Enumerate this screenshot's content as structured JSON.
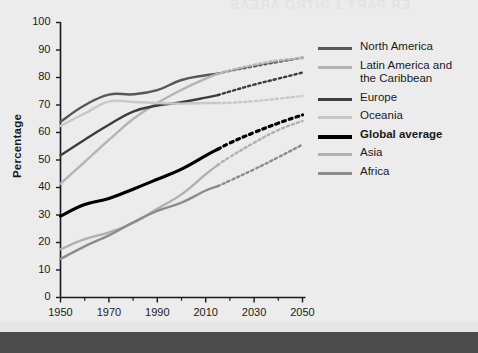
{
  "page": {
    "background_color": "#ececec",
    "footer_bar_color": "#4b4b4b",
    "bleed_text": "ER PART 1 INTRO AREAS",
    "bleed_text_small": "world population, 1950-2050"
  },
  "chart_data": {
    "type": "line",
    "title": "",
    "subtitle": "",
    "xlabel": "",
    "ylabel": "Percentage",
    "xlim": [
      1950,
      2050
    ],
    "ylim": [
      0,
      100
    ],
    "grid": false,
    "legend_position": "right",
    "x_ticks": [
      "1950",
      "1970",
      "1990",
      "2010",
      "2030",
      "2050"
    ],
    "x_tick_values": [
      1950,
      1970,
      1990,
      2010,
      2030,
      2050
    ],
    "x_minor_ticks": [
      1960,
      1980,
      2000,
      2020,
      2040
    ],
    "y_ticks": [
      "0",
      "10",
      "20",
      "30",
      "40",
      "50",
      "60",
      "70",
      "80",
      "90",
      "100"
    ],
    "y_tick_values": [
      0,
      10,
      20,
      30,
      40,
      50,
      60,
      70,
      80,
      90,
      100
    ],
    "projection_start_year": 2015,
    "x": [
      1950,
      1960,
      1970,
      1980,
      1990,
      2000,
      2010,
      2015,
      2020,
      2030,
      2040,
      2050
    ],
    "series": [
      {
        "name": "North America",
        "color": "#575757",
        "width": 2.4,
        "values": [
          63.9,
          69.9,
          73.8,
          73.9,
          75.4,
          79.1,
          80.8,
          81.4,
          82.4,
          84.1,
          85.7,
          87.2
        ]
      },
      {
        "name": "Latin America and the Caribbean",
        "color": "#b4b4b4",
        "width": 2.4,
        "values": [
          41.4,
          49.3,
          57.3,
          64.9,
          70.7,
          75.5,
          79.6,
          81.3,
          82.6,
          84.6,
          86.2,
          87.1
        ]
      },
      {
        "name": "Europe",
        "color": "#3d3d3d",
        "width": 2.4,
        "values": [
          51.7,
          57.4,
          62.8,
          67.6,
          69.8,
          71.0,
          72.7,
          73.6,
          74.9,
          77.4,
          79.6,
          81.8
        ]
      },
      {
        "name": "Oceania",
        "color": "#c8c8c8",
        "width": 2.4,
        "values": [
          62.4,
          66.9,
          71.2,
          71.1,
          70.7,
          70.5,
          70.7,
          70.7,
          70.8,
          71.4,
          72.3,
          73.3
        ]
      },
      {
        "name": "Global average",
        "color": "#000000",
        "width": 3.2,
        "values": [
          29.6,
          33.8,
          36.0,
          39.4,
          43.0,
          46.7,
          51.6,
          53.9,
          56.2,
          60.0,
          63.4,
          66.4
        ]
      },
      {
        "name": "Asia",
        "color": "#b0b0b0",
        "width": 2.4,
        "values": [
          17.5,
          21.2,
          23.7,
          27.1,
          32.3,
          37.5,
          44.8,
          48.2,
          51.1,
          56.3,
          60.9,
          64.2
        ]
      },
      {
        "name": "Africa",
        "color": "#8c8c8c",
        "width": 2.4,
        "values": [
          14.0,
          18.6,
          22.6,
          27.3,
          31.5,
          34.5,
          38.9,
          40.5,
          42.5,
          46.6,
          51.0,
          55.6
        ]
      }
    ]
  },
  "legend": {
    "items": [
      {
        "label": "North America",
        "color": "#575757",
        "bold": false,
        "width": 3
      },
      {
        "label": "Latin America and\nthe Caribbean",
        "color": "#b4b4b4",
        "bold": false,
        "width": 3
      },
      {
        "label": "Europe",
        "color": "#3d3d3d",
        "bold": false,
        "width": 3
      },
      {
        "label": "Oceania",
        "color": "#c8c8c8",
        "bold": false,
        "width": 3
      },
      {
        "label": "Global average",
        "color": "#000000",
        "bold": true,
        "width": 4
      },
      {
        "label": "Asia",
        "color": "#b0b0b0",
        "bold": false,
        "width": 3
      },
      {
        "label": "Africa",
        "color": "#8c8c8c",
        "bold": false,
        "width": 3
      }
    ]
  }
}
